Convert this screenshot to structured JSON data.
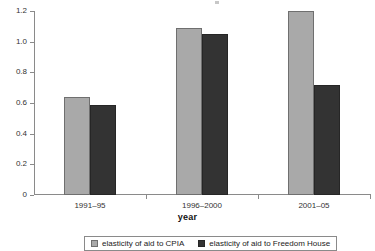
{
  "chart_data": {
    "type": "bar",
    "title": "",
    "xlabel": "year",
    "ylabel": "",
    "categories": [
      "1991–95",
      "1996–2000",
      "2001–05"
    ],
    "series": [
      {
        "name": "elasticity of aid to CPIA",
        "color": "#a9a9a9",
        "values": [
          0.64,
          1.09,
          1.2
        ]
      },
      {
        "name": "elasticity of aid to Freedom House",
        "color": "#333333",
        "values": [
          0.59,
          1.05,
          0.72
        ]
      }
    ],
    "ylim": [
      0,
      1.2
    ],
    "ytick_labels": [
      "0",
      "0.2",
      "0.4",
      "0.6",
      "0.8",
      "1.0",
      "1.2"
    ],
    "ytick_values": [
      0,
      0.2,
      0.4,
      0.6,
      0.8,
      1.0,
      1.2
    ],
    "grid": false,
    "legend_position": "bottom"
  },
  "axis": {
    "x_title": "year"
  },
  "legend": {
    "items": [
      {
        "label": "elasticity of aid to CPIA"
      },
      {
        "label": "elasticity of aid to Freedom House"
      }
    ]
  }
}
